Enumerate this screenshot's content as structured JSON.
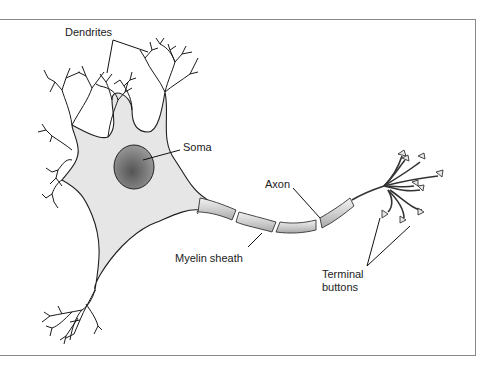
{
  "figure": {
    "colors": {
      "outline": "#222222",
      "soma_fill": "#e4e4e4",
      "nucleus_fill": "#7a7a7a",
      "myelin_fill": "#d6d6d6",
      "frame": "#8a8a8a",
      "background": "#ffffff"
    },
    "labels": {
      "dendrites": "Dendrites",
      "soma": "Soma",
      "axon": "Axon",
      "myelin_sheath": "Myelin sheath",
      "terminal_buttons_line1": "Terminal",
      "terminal_buttons_line2": "buttons"
    }
  }
}
